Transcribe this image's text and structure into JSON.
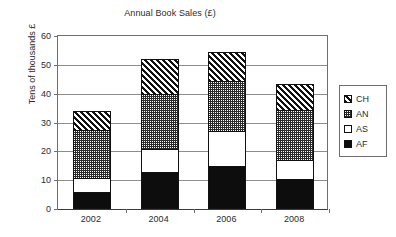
{
  "chart_data": {
    "type": "bar",
    "subtype": "stacked",
    "title": "Annual Book Sales (£)",
    "xlabel": "",
    "ylabel": "Tens of thousands £",
    "categories": [
      "2002",
      "2004",
      "2006",
      "2008"
    ],
    "ylim": [
      0,
      60
    ],
    "yticks": [
      0,
      10,
      20,
      30,
      40,
      50,
      60
    ],
    "grid": true,
    "legend_position": "right",
    "series": [
      {
        "name": "AF",
        "pattern": "solid-black",
        "values": [
          6,
          13,
          15,
          10.5
        ]
      },
      {
        "name": "AS",
        "pattern": "white",
        "values": [
          5,
          8,
          12.5,
          7
        ]
      },
      {
        "name": "AN",
        "pattern": "fine-dotted",
        "values": [
          17,
          19.5,
          17.5,
          17.5
        ]
      },
      {
        "name": "CH",
        "pattern": "diagonal-hatch",
        "values": [
          7,
          12.5,
          10.5,
          9.5
        ]
      }
    ],
    "stack_tops": {
      "2002": {
        "AF": 6,
        "AS": 11,
        "AN": 28,
        "CH": 35
      },
      "2004": {
        "AF": 13,
        "AS": 21,
        "AN": 40.5,
        "CH": 53
      },
      "2006": {
        "AF": 15,
        "AS": 27.5,
        "AN": 45,
        "CH": 55.5
      },
      "2008": {
        "AF": 10.5,
        "AS": 17.5,
        "AN": 35,
        "CH": 44.5
      }
    },
    "totals": [
      35,
      53,
      55.5,
      44.5
    ]
  },
  "legend": {
    "items": [
      {
        "label": "CH",
        "series": "CH"
      },
      {
        "label": "AN",
        "series": "AN"
      },
      {
        "label": "AS",
        "series": "AS"
      },
      {
        "label": "AF",
        "series": "AF"
      }
    ]
  },
  "colors": {
    "ink": "#111111",
    "axis": "#6f6f6f",
    "grid": "#8d8d8d",
    "plot_bg": "#ffffff",
    "page_bg": "#ffffff"
  }
}
